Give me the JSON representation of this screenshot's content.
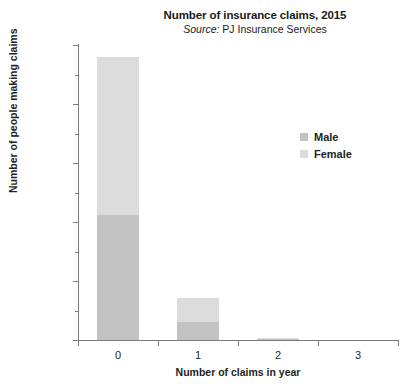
{
  "chart_data": {
    "type": "bar",
    "subtype": "stacked",
    "title": "Number of insurance claims, 2015",
    "subtitle_prefix": "Source:",
    "subtitle_text": "PJ Insurance Services",
    "xlabel": "Number of claims in year",
    "ylabel": "Number of people making claims",
    "categories": [
      "0",
      "1",
      "2",
      "3"
    ],
    "series": [
      {
        "name": "Male",
        "color": "#c3c3c3",
        "values": [
          10600,
          1500,
          100,
          0
        ]
      },
      {
        "name": "Female",
        "color": "#dcdcdc",
        "values": [
          13400,
          2050,
          60,
          0
        ]
      }
    ],
    "totals": [
      24000,
      3550,
      160,
      0
    ],
    "ylim": [
      0,
      25000
    ],
    "ytick_labels": [
      "0",
      "5000",
      "10000",
      "15000",
      "20000",
      "25000"
    ],
    "ytick_values": [
      0,
      5000,
      10000,
      15000,
      20000,
      25000
    ],
    "yminor_values": [
      2500,
      7500,
      12500,
      17500,
      22500
    ],
    "grid": false,
    "legend_position": "right",
    "legend_entries": [
      {
        "label": "Male",
        "color": "#c3c3c3"
      },
      {
        "label": "Female",
        "color": "#dcdcdc"
      }
    ]
  }
}
